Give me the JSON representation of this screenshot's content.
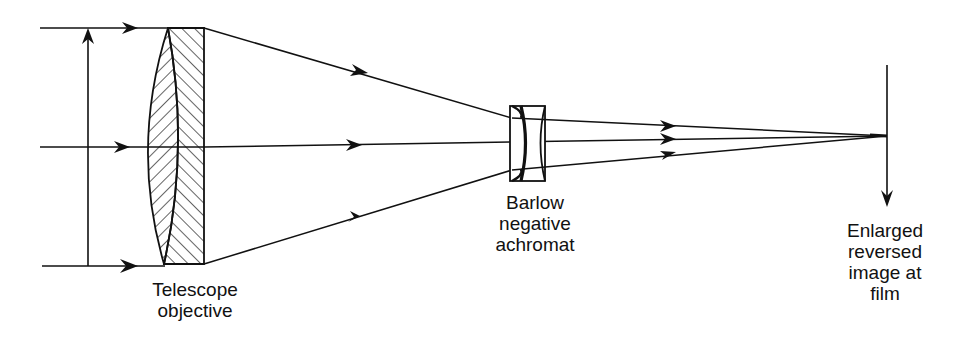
{
  "diagram": {
    "type": "optical ray diagram",
    "colors": {
      "line": "#111111",
      "background": "#ffffff"
    },
    "labels": {
      "objective": "Telescope\nobjective",
      "barlow": "Barlow\nnegative\nachromat",
      "film": "Enlarged\nreversed\nimage at\nfilm"
    },
    "elements": [
      {
        "name": "incoming-parallel-rays",
        "count": 3
      },
      {
        "name": "aperture-arrow",
        "direction": "up"
      },
      {
        "name": "telescope-objective",
        "kind": "cemented doublet (hatched)"
      },
      {
        "name": "barlow-lens",
        "kind": "negative achromat"
      },
      {
        "name": "film-plane",
        "direction": "down"
      }
    ]
  }
}
